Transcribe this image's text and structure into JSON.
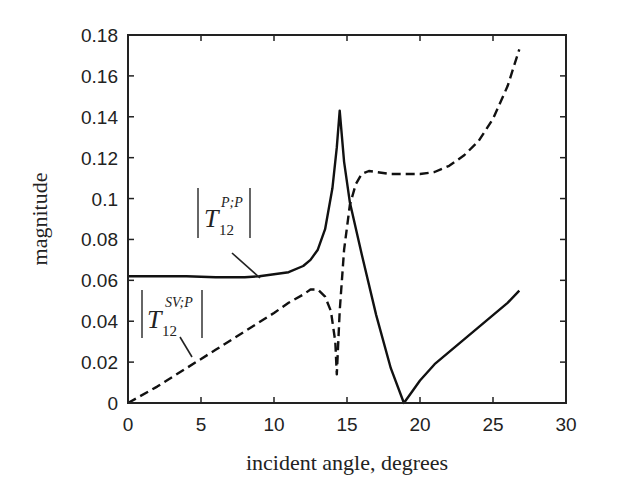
{
  "chart_data": {
    "type": "line",
    "title": "",
    "xlabel": "incident angle, degrees",
    "ylabel": "magnitude",
    "xlim": [
      0,
      30
    ],
    "ylim": [
      0,
      0.18
    ],
    "xticks": [
      "0",
      "5",
      "10",
      "15",
      "20",
      "25",
      "30"
    ],
    "yticks": [
      "0",
      "0.02",
      "0.04",
      "0.06",
      "0.08",
      "0.1",
      "0.12",
      "0.14",
      "0.16",
      "0.18"
    ],
    "grid": false,
    "legend": "inline annotations",
    "series": [
      {
        "name": "|T12^{P;P}|",
        "style": "solid",
        "x": [
          0,
          2,
          4,
          6,
          8,
          9,
          10,
          11,
          12,
          12.5,
          13,
          13.5,
          14,
          14.3,
          14.5,
          14.8,
          15.2,
          16,
          17,
          18,
          18.9,
          19.5,
          20,
          21,
          22,
          23,
          24,
          25,
          26,
          26.8
        ],
        "y": [
          0.062,
          0.062,
          0.062,
          0.0615,
          0.0615,
          0.062,
          0.063,
          0.064,
          0.067,
          0.07,
          0.075,
          0.085,
          0.105,
          0.125,
          0.143,
          0.118,
          0.098,
          0.073,
          0.043,
          0.017,
          0.0,
          0.006,
          0.011,
          0.019,
          0.025,
          0.031,
          0.037,
          0.043,
          0.049,
          0.055
        ]
      },
      {
        "name": "|T12^{SV;P}|",
        "style": "dashed",
        "x": [
          0,
          2,
          4,
          6,
          8,
          10,
          11,
          12,
          12.5,
          13,
          13.5,
          13.9,
          14.2,
          14.3,
          14.5,
          14.8,
          15.2,
          15.6,
          16,
          16.5,
          17,
          18,
          19,
          20,
          21,
          22,
          23,
          24,
          25,
          26,
          26.8
        ],
        "y": [
          0.0,
          0.008,
          0.017,
          0.026,
          0.035,
          0.044,
          0.049,
          0.053,
          0.0555,
          0.0555,
          0.052,
          0.045,
          0.03,
          0.014,
          0.045,
          0.075,
          0.097,
          0.107,
          0.112,
          0.1135,
          0.113,
          0.112,
          0.112,
          0.112,
          0.113,
          0.116,
          0.121,
          0.128,
          0.139,
          0.155,
          0.173
        ]
      }
    ],
    "annotations": [
      {
        "text_main": "T",
        "sub": "12",
        "sup": "P;P",
        "points_to": [
          9,
          0.0615
        ]
      },
      {
        "text_main": "T",
        "sub": "12",
        "sup": "SV;P",
        "points_to": [
          3,
          0.022
        ]
      }
    ]
  }
}
